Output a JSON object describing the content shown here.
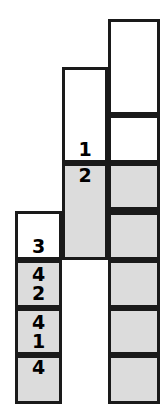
{
  "figure": {
    "type": "stacked-cell-columns",
    "background_color": "#ffffff",
    "fill_color": "#dcdcdc",
    "border_color": "#1a1a1a",
    "columns": [
      {
        "name": "left-column",
        "cells": [
          {
            "id": "left-cell-1",
            "filled": false,
            "label": "3",
            "label_position": "bottom"
          },
          {
            "id": "left-cell-2",
            "filled": true,
            "label_top": "4",
            "label_bottom": "2"
          },
          {
            "id": "left-cell-3",
            "filled": true,
            "label_top": "4",
            "label_bottom": "1"
          },
          {
            "id": "left-cell-4",
            "filled": true,
            "label": "4",
            "label_position": "top"
          }
        ]
      },
      {
        "name": "middle-column",
        "cells": [
          {
            "id": "middle-cell-1",
            "filled": false,
            "label": "1",
            "label_position": "bottom"
          },
          {
            "id": "middle-cell-2",
            "filled": true,
            "label": "2",
            "label_position": "top"
          }
        ]
      },
      {
        "name": "right-column",
        "cells": [
          {
            "id": "right-cell-1",
            "filled": false,
            "label": ""
          },
          {
            "id": "right-cell-2",
            "filled": false,
            "label": ""
          },
          {
            "id": "right-cell-3",
            "filled": true,
            "label": ""
          },
          {
            "id": "right-cell-4",
            "filled": true,
            "label": "",
            "thick_top_border": true
          },
          {
            "id": "right-cell-5",
            "filled": true,
            "label": ""
          },
          {
            "id": "right-cell-6",
            "filled": true,
            "label": ""
          },
          {
            "id": "right-cell-7",
            "filled": true,
            "label": ""
          }
        ]
      }
    ]
  }
}
